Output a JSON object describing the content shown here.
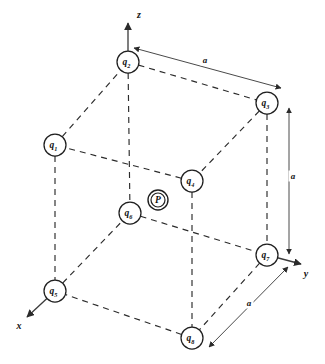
{
  "figure": {
    "width": 325,
    "height": 364,
    "background_color": "#ffffff",
    "line_color": "#2b2b2b",
    "edge_style": "dashed"
  },
  "axes": [
    {
      "id": "z",
      "label": "z",
      "label_x": 139,
      "label_y": 14,
      "x1": 128,
      "y1": 62,
      "x2": 128,
      "y2": 23,
      "direction": "up"
    },
    {
      "id": "y",
      "label": "y",
      "label_x": 306,
      "label_y": 273,
      "x1": 267,
      "y1": 255,
      "x2": 301,
      "y2": 264,
      "direction": "right-down"
    },
    {
      "id": "x",
      "label": "x",
      "label_x": 19,
      "label_y": 325,
      "x1": 55,
      "y1": 291,
      "x2": 27,
      "y2": 317,
      "direction": "down-left"
    }
  ],
  "charges": [
    {
      "id": "q1",
      "label": "q",
      "subscript": "1",
      "cx": 55,
      "cy": 145,
      "r": 11,
      "face": "top"
    },
    {
      "id": "q2",
      "label": "q",
      "subscript": "2",
      "cx": 128,
      "cy": 62,
      "r": 11,
      "face": "top"
    },
    {
      "id": "q3",
      "label": "q",
      "subscript": "3",
      "cx": 267,
      "cy": 103,
      "r": 11,
      "face": "top"
    },
    {
      "id": "q4",
      "label": "q",
      "subscript": "4",
      "cx": 192,
      "cy": 181,
      "r": 11,
      "face": "top"
    },
    {
      "id": "q5",
      "label": "q",
      "subscript": "5",
      "cx": 55,
      "cy": 291,
      "r": 11,
      "face": "bottom"
    },
    {
      "id": "q6",
      "label": "q",
      "subscript": "6",
      "cx": 130,
      "cy": 213,
      "r": 11,
      "face": "bottom"
    },
    {
      "id": "q7",
      "label": "q",
      "subscript": "7",
      "cx": 267,
      "cy": 255,
      "r": 11,
      "face": "bottom"
    },
    {
      "id": "q8",
      "label": "q",
      "subscript": "8",
      "cx": 192,
      "cy": 338,
      "r": 11,
      "face": "bottom"
    }
  ],
  "field_point": {
    "id": "P",
    "label": "P",
    "cx": 158,
    "cy": 200,
    "outer_r": 10,
    "inner_r": 7,
    "marker": "double-circle"
  },
  "edges": [
    {
      "from": "q1",
      "to": "q2",
      "kind": "top-face"
    },
    {
      "from": "q2",
      "to": "q3",
      "kind": "top-face"
    },
    {
      "from": "q3",
      "to": "q4",
      "kind": "top-face"
    },
    {
      "from": "q4",
      "to": "q1",
      "kind": "top-face"
    },
    {
      "from": "q5",
      "to": "q6",
      "kind": "bottom-face"
    },
    {
      "from": "q6",
      "to": "q7",
      "kind": "bottom-face"
    },
    {
      "from": "q7",
      "to": "q8",
      "kind": "bottom-face"
    },
    {
      "from": "q8",
      "to": "q5",
      "kind": "bottom-face"
    },
    {
      "from": "q1",
      "to": "q5",
      "kind": "vertical"
    },
    {
      "from": "q2",
      "to": "q6",
      "kind": "vertical"
    },
    {
      "from": "q3",
      "to": "q7",
      "kind": "vertical"
    },
    {
      "from": "q4",
      "to": "q8",
      "kind": "vertical"
    }
  ],
  "dimensions": [
    {
      "id": "a-top",
      "label": "a",
      "label_x": 205,
      "label_y": 60,
      "x1": 134,
      "y1": 48,
      "x2": 281,
      "y2": 88,
      "arrows": "both"
    },
    {
      "id": "a-vertical",
      "label": "a",
      "label_x": 293,
      "label_y": 176,
      "x1": 289,
      "y1": 108,
      "x2": 289,
      "y2": 254,
      "arrows": "both"
    },
    {
      "id": "a-bottom",
      "label": "a",
      "label_x": 249,
      "label_y": 303,
      "x1": 209,
      "y1": 347,
      "x2": 288,
      "y2": 267,
      "arrows": "both"
    }
  ]
}
